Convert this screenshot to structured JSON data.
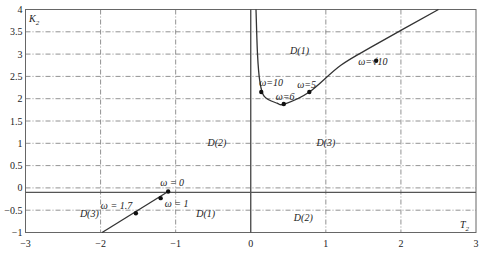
{
  "chart_data": {
    "type": "line",
    "title": "",
    "xlabel": "T2",
    "ylabel": "K2",
    "xlim": [
      -3,
      3
    ],
    "ylim": [
      -1,
      4
    ],
    "x_ticks": [
      "-3",
      "-2",
      "-1",
      "0",
      "1",
      "2",
      "3"
    ],
    "y_ticks": [
      "4",
      "3.5",
      "3",
      "2.5",
      "2",
      "1.5",
      "1",
      "0.5",
      "0",
      "-0.5",
      "-1"
    ],
    "grid": true,
    "grid_style": "dash-dot",
    "horizontal_boundary": {
      "K2": -0.1,
      "style": "solid"
    },
    "series": [
      {
        "name": "left boundary branch",
        "points": [
          [
            -1.98,
            -1.0
          ],
          [
            -1.1,
            -0.08
          ]
        ],
        "markers": [
          {
            "label": "ω = 1.7",
            "T2": -1.53,
            "K2": -0.57
          },
          {
            "label": "ω = 1",
            "T2": -1.2,
            "K2": -0.23
          },
          {
            "label": "ω = 0",
            "T2": -1.1,
            "K2": -0.08
          }
        ]
      },
      {
        "name": "right boundary branch",
        "points": [
          [
            0.07,
            4.0
          ],
          [
            0.09,
            3.0
          ],
          [
            0.12,
            2.4
          ],
          [
            0.18,
            2.05
          ],
          [
            0.35,
            1.9
          ],
          [
            0.45,
            1.88
          ],
          [
            0.78,
            2.15
          ],
          [
            1.2,
            2.75
          ],
          [
            1.65,
            3.2
          ],
          [
            2.5,
            4.0
          ]
        ],
        "markers": [
          {
            "label": "ω=10",
            "T2": 0.14,
            "K2": 2.15
          },
          {
            "label": "ω=6",
            "T2": 0.44,
            "K2": 1.88
          },
          {
            "label": "ω=5",
            "T2": 0.78,
            "K2": 2.15
          },
          {
            "label": "ω=√10",
            "T2": 1.67,
            "K2": 2.85
          }
        ]
      }
    ],
    "regions": [
      {
        "label": "D(1)",
        "T2": 0.65,
        "K2": 3.0
      },
      {
        "label": "D(2)",
        "T2": -0.45,
        "K2": 0.95
      },
      {
        "label": "D(3)",
        "T2": 1.0,
        "K2": 0.95
      },
      {
        "label": "D(3)",
        "T2": -2.15,
        "K2": -0.65
      },
      {
        "label": "D(1)",
        "T2": -0.6,
        "K2": -0.65
      },
      {
        "label": "D(2)",
        "T2": 0.7,
        "K2": -0.75
      }
    ]
  },
  "labels": {
    "y_axis_name": "K",
    "y_axis_sub": "2",
    "x_axis_name": "T",
    "x_axis_sub": "2"
  }
}
